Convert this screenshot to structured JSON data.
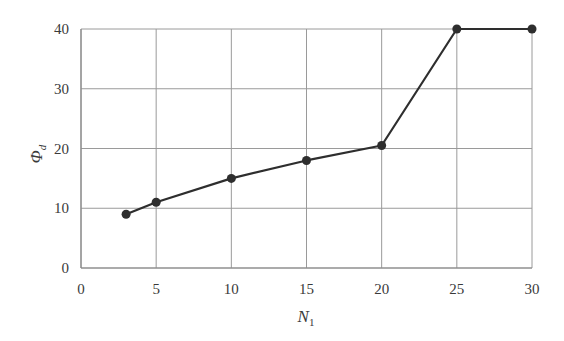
{
  "chart_data": {
    "type": "line",
    "title": "",
    "xlabel": "N",
    "xlabel_subscript": "1",
    "ylabel": "Φ",
    "ylabel_subscript": "d",
    "xlim": [
      0,
      30
    ],
    "ylim": [
      0,
      40
    ],
    "xticks": [
      0,
      5,
      10,
      15,
      20,
      25,
      30
    ],
    "yticks": [
      0,
      10,
      20,
      30,
      40
    ],
    "grid": true,
    "legend": null,
    "series": [
      {
        "name": "Φd",
        "x": [
          3,
          5,
          10,
          15,
          20,
          25,
          30
        ],
        "values": [
          9,
          11,
          15,
          18,
          20.5,
          40,
          40
        ],
        "marker": "circle",
        "color": "#2e2e2e"
      }
    ]
  },
  "style": {
    "line_color": "#2e2e2e",
    "grid_color": "#9a9a9a",
    "axis_color": "#8a8a8a",
    "text_color": "#3a3a3a"
  }
}
